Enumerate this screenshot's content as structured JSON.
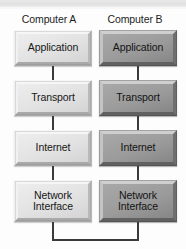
{
  "diagram": {
    "type": "layered-stack",
    "background_color": "#fdfdfd",
    "columns": [
      {
        "id": "computer-a",
        "header": "Computer A",
        "style": "light",
        "fill_color": "#e3e3e3",
        "layers": [
          {
            "label": "Application"
          },
          {
            "label": "Transport"
          },
          {
            "label": "Internet"
          },
          {
            "label": "Network\nInterface",
            "line1": "Network",
            "line2": "Interface"
          }
        ]
      },
      {
        "id": "computer-b",
        "header": "Computer B",
        "style": "dark",
        "fill_color": "#9a9a9a",
        "layers": [
          {
            "label": "Application"
          },
          {
            "label": "Transport"
          },
          {
            "label": "Internet"
          },
          {
            "label": "Network\nInterface",
            "line1": "Network",
            "line2": "Interface"
          }
        ]
      }
    ],
    "connectors": {
      "vertical_color": "#3a3a3a",
      "bottom_link_color": "#3a3a3a",
      "bottom_link_description": "U-shaped line joining the two Network Interface layers"
    }
  }
}
